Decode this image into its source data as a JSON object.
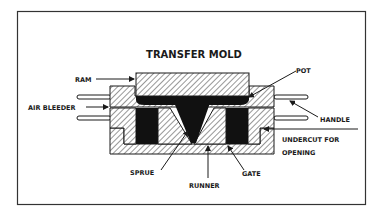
{
  "diagram": {
    "title": "TRANSFER MOLD",
    "labels": {
      "ram": "RAM",
      "pot": "POT",
      "air_bleeder": "AIR BLEEDER",
      "handle": "HANDLE",
      "undercut_line1": "UNDERCUT FOR",
      "undercut_line2": "OPENING",
      "sprue": "SPRUE",
      "runner": "RUNNER",
      "gate": "GATE"
    },
    "colors": {
      "ink": "#1a1a1a",
      "frame": "#333333",
      "background": "#ffffff"
    }
  }
}
